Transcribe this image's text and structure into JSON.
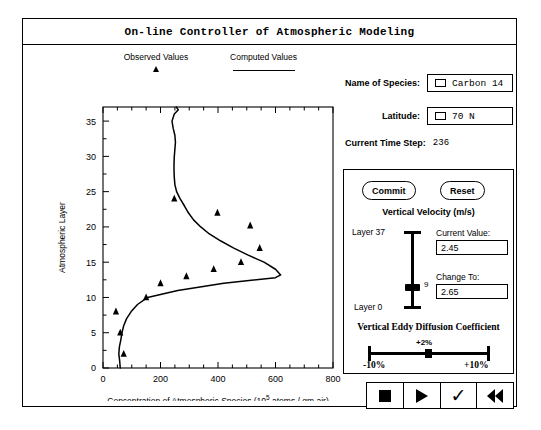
{
  "window": {
    "title": "On-line Controller of Atmospheric Modeling"
  },
  "legend": {
    "observed_label": "Observed Values",
    "observed_marker": "triangle-marker",
    "computed_label": "Computed Values",
    "computed_marker": "line-marker"
  },
  "fields": {
    "species_label": "Name of Species:",
    "species_value": "Carbon 14",
    "latitude_label": "Latitude:",
    "latitude_value": "70 N",
    "timestep_label": "Current Time Step:",
    "timestep_value": "236"
  },
  "controls": {
    "commit_label": "Commit",
    "reset_label": "Reset",
    "velocity_title": "Vertical Velocity (m/s)",
    "layer_top_label": "Layer 37",
    "layer_bottom_label": "Layer 0",
    "layer_handle_value": "9",
    "current_value_label": "Current Value:",
    "current_value": "2.45",
    "change_to_label": "Change To:",
    "change_to_value": "2.65",
    "eddy_title": "Vertical Eddy Diffusion Coefficient",
    "eddy_current": "+2%",
    "eddy_min": "-10%",
    "eddy_max": "+10%"
  },
  "transport": {
    "stop_name": "stop-icon",
    "play_name": "play-icon",
    "accept_name": "checkmark-icon",
    "rewind_name": "rewind-icon",
    "accept_glyph": "✓"
  },
  "chart_data": {
    "type": "line",
    "title": "",
    "xlabel": "Concentration of Atmospheric Species (10^5 atoms / gm air)",
    "xlabel_prefix": "Concentration of Atmospheric Species (10",
    "xlabel_sup": "5",
    "xlabel_suffix": " atoms / gm air)",
    "ylabel": "Atmospheric Layer",
    "xlim": [
      0,
      800
    ],
    "ylim": [
      0,
      37
    ],
    "xticks": [
      0,
      200,
      400,
      600,
      800
    ],
    "yticks": [
      0,
      5,
      10,
      15,
      20,
      25,
      30,
      35
    ],
    "grid": false,
    "legend_position": "above-plot",
    "series": [
      {
        "name": "Computed Values",
        "type": "line",
        "points": [
          [
            60,
            0
          ],
          [
            58,
            1
          ],
          [
            55,
            2
          ],
          [
            57,
            3
          ],
          [
            62,
            4
          ],
          [
            66,
            5
          ],
          [
            72,
            6
          ],
          [
            82,
            7
          ],
          [
            98,
            8
          ],
          [
            120,
            9
          ],
          [
            155,
            10
          ],
          [
            260,
            11
          ],
          [
            420,
            12
          ],
          [
            600,
            12.8
          ],
          [
            618,
            13.2
          ],
          [
            600,
            14
          ],
          [
            560,
            15
          ],
          [
            505,
            16
          ],
          [
            455,
            17
          ],
          [
            410,
            18
          ],
          [
            370,
            19
          ],
          [
            340,
            20
          ],
          [
            315,
            21
          ],
          [
            297,
            22
          ],
          [
            283,
            23
          ],
          [
            268,
            24
          ],
          [
            256,
            25
          ],
          [
            250,
            26
          ],
          [
            248,
            27
          ],
          [
            247,
            28
          ],
          [
            247,
            29
          ],
          [
            248,
            30
          ],
          [
            250,
            31
          ],
          [
            252,
            32
          ],
          [
            250,
            33
          ],
          [
            244,
            34
          ],
          [
            240,
            35
          ],
          [
            248,
            36
          ],
          [
            262,
            36.6
          ],
          [
            255,
            37
          ]
        ]
      },
      {
        "name": "Observed Values",
        "type": "scatter",
        "points": [
          [
            72,
            2
          ],
          [
            60,
            5
          ],
          [
            45,
            8
          ],
          [
            150,
            10
          ],
          [
            200,
            12
          ],
          [
            290,
            13
          ],
          [
            385,
            14
          ],
          [
            480,
            15
          ],
          [
            545,
            17
          ],
          [
            512,
            20.2
          ],
          [
            398,
            22
          ],
          [
            248,
            24
          ]
        ]
      }
    ]
  }
}
